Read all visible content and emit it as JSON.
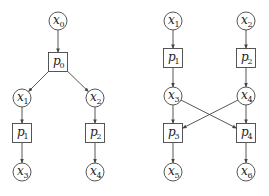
{
  "colors": {
    "stroke": "#444444",
    "text": "#222222",
    "background": "#ffffff"
  },
  "graphs": [
    {
      "name": "left-graph",
      "nodes": [
        {
          "id": "x0",
          "shape": "circle",
          "base": "x",
          "sub": "0",
          "cx": 58,
          "cy": 21
        },
        {
          "id": "p0",
          "shape": "square",
          "base": "p",
          "sub": "0",
          "cx": 58,
          "cy": 62
        },
        {
          "id": "x1",
          "shape": "circle",
          "base": "x",
          "sub": "1",
          "cx": 22,
          "cy": 98
        },
        {
          "id": "x2",
          "shape": "circle",
          "base": "x",
          "sub": "2",
          "cx": 95,
          "cy": 98
        },
        {
          "id": "p1",
          "shape": "square",
          "base": "p",
          "sub": "1",
          "cx": 22,
          "cy": 133
        },
        {
          "id": "p2",
          "shape": "square",
          "base": "p",
          "sub": "2",
          "cx": 95,
          "cy": 133
        },
        {
          "id": "x3",
          "shape": "circle",
          "base": "x",
          "sub": "3",
          "cx": 22,
          "cy": 172
        },
        {
          "id": "x4",
          "shape": "circle",
          "base": "x",
          "sub": "4",
          "cx": 95,
          "cy": 172
        }
      ],
      "edges": [
        {
          "from": "x0",
          "to": "p0"
        },
        {
          "from": "p0",
          "to": "x1"
        },
        {
          "from": "p0",
          "to": "x2"
        },
        {
          "from": "x1",
          "to": "p1"
        },
        {
          "from": "x2",
          "to": "p2"
        },
        {
          "from": "p1",
          "to": "x3"
        },
        {
          "from": "p2",
          "to": "x4"
        }
      ]
    },
    {
      "name": "right-graph",
      "nodes": [
        {
          "id": "x1",
          "shape": "circle",
          "base": "x",
          "sub": "1",
          "cx": 173,
          "cy": 21
        },
        {
          "id": "x2",
          "shape": "circle",
          "base": "x",
          "sub": "2",
          "cx": 246,
          "cy": 21
        },
        {
          "id": "p1",
          "shape": "square",
          "base": "p",
          "sub": "1",
          "cx": 173,
          "cy": 58
        },
        {
          "id": "p2",
          "shape": "square",
          "base": "p",
          "sub": "2",
          "cx": 246,
          "cy": 58
        },
        {
          "id": "x3",
          "shape": "circle",
          "base": "x",
          "sub": "3",
          "cx": 173,
          "cy": 96
        },
        {
          "id": "x4",
          "shape": "circle",
          "base": "x",
          "sub": "4",
          "cx": 246,
          "cy": 96
        },
        {
          "id": "p3",
          "shape": "square",
          "base": "p",
          "sub": "3",
          "cx": 173,
          "cy": 133
        },
        {
          "id": "p4",
          "shape": "square",
          "base": "p",
          "sub": "4",
          "cx": 246,
          "cy": 133
        },
        {
          "id": "x5",
          "shape": "circle",
          "base": "x",
          "sub": "5",
          "cx": 173,
          "cy": 172
        },
        {
          "id": "x6",
          "shape": "circle",
          "base": "x",
          "sub": "6",
          "cx": 246,
          "cy": 172
        }
      ],
      "edges": [
        {
          "from": "x1",
          "to": "p1"
        },
        {
          "from": "x2",
          "to": "p2"
        },
        {
          "from": "p1",
          "to": "x3"
        },
        {
          "from": "p2",
          "to": "x4"
        },
        {
          "from": "x3",
          "to": "p3"
        },
        {
          "from": "x3",
          "to": "p4"
        },
        {
          "from": "x4",
          "to": "p3"
        },
        {
          "from": "x4",
          "to": "p4"
        },
        {
          "from": "p3",
          "to": "x5"
        },
        {
          "from": "p4",
          "to": "x6"
        }
      ]
    }
  ]
}
